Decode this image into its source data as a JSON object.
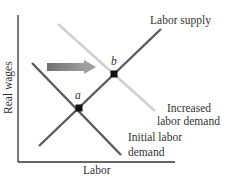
{
  "diagram": {
    "title": "",
    "axes": {
      "x_label": "Labor",
      "y_label": "Real wages"
    },
    "curves": [
      {
        "id": "labor_supply",
        "label": "Labor supply",
        "color": "#5a5a5a",
        "slope": "upward"
      },
      {
        "id": "initial_labor_demand",
        "label_line1": "Initial labor",
        "label_line2": "demand",
        "color": "#5a5a5a",
        "slope": "downward"
      },
      {
        "id": "increased_labor_demand",
        "label_line1": "Increased",
        "label_line2": "labor demand",
        "color": "#cfcfcf",
        "slope": "downward"
      }
    ],
    "points": [
      {
        "id": "a",
        "label": "a",
        "meaning": "initial equilibrium"
      },
      {
        "id": "b",
        "label": "b",
        "meaning": "new equilibrium"
      }
    ],
    "arrow": {
      "direction": "right",
      "meaning": "demand shift",
      "color_start": "#6f6f6f",
      "color_end": "#a0a0a0"
    }
  }
}
